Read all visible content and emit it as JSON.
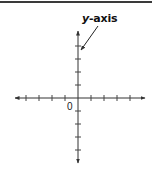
{
  "diagram": {
    "title_label": {
      "var": "y",
      "rest": "-axis"
    },
    "origin_label": "0",
    "colors": {
      "axis": "#333333",
      "text": "#111111",
      "rule": "#3a3a3a"
    },
    "x_axis": {
      "ticks_left": 4,
      "ticks_right": 4,
      "arrows": "both"
    },
    "y_axis": {
      "ticks_up": 4,
      "ticks_down": 4,
      "arrows": "both"
    },
    "callout": {
      "target": "y-axis"
    }
  }
}
